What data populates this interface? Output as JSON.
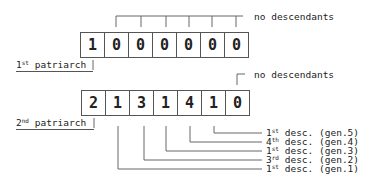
{
  "diagram": {
    "arrays": [
      {
        "id": "first",
        "cells": [
          "1",
          "0",
          "0",
          "0",
          "0",
          "0",
          "0"
        ],
        "label": {
          "ord": "1",
          "sup": "st",
          "text": "patriarch"
        },
        "annotation": "no descendants"
      },
      {
        "id": "second",
        "cells": [
          "2",
          "1",
          "3",
          "1",
          "4",
          "1",
          "0"
        ],
        "label": {
          "ord": "2",
          "sup": "nd",
          "text": "patriarch"
        },
        "annotation": "no descendants",
        "descendant_labels": [
          {
            "ord": "1",
            "sup": "st",
            "text": "desc. (gen.5)"
          },
          {
            "ord": "4",
            "sup": "th",
            "text": "desc. (gen.4)"
          },
          {
            "ord": "1",
            "sup": "st",
            "text": "desc. (gen.3)"
          },
          {
            "ord": "3",
            "sup": "rd",
            "text": "desc. (gen.2)"
          },
          {
            "ord": "1",
            "sup": "st",
            "text": "desc. (gen.1)"
          }
        ]
      }
    ]
  }
}
